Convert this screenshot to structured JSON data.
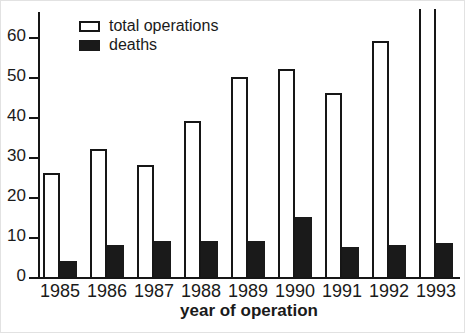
{
  "chart_data": {
    "type": "bar",
    "title": "",
    "xlabel": "year of operation",
    "ylabel": "",
    "categories": [
      "1985",
      "1986",
      "1987",
      "1988",
      "1989",
      "1990",
      "1991",
      "1992",
      "1993"
    ],
    "series": [
      {
        "name": "total operations",
        "fill": "#ffffff",
        "outline": "#161616",
        "values": [
          26,
          32,
          28,
          39,
          50,
          52,
          46,
          59,
          67
        ]
      },
      {
        "name": "deaths",
        "fill": "#1a1a1a",
        "values": [
          4,
          8,
          9,
          9,
          9,
          15,
          7.5,
          8,
          8.5
        ]
      }
    ],
    "clipped_bars": [
      {
        "series": "total operations",
        "category": "1993",
        "note": "bar extends past top of plot, off-scale"
      }
    ],
    "ylim": [
      0,
      66
    ],
    "yticks": [
      0,
      10,
      20,
      30,
      40,
      50,
      60
    ],
    "grid": false,
    "legend_position": "top-left"
  },
  "colors": {
    "background": "#ffffff",
    "axis": "#161616",
    "bar_fill_deaths": "#1a1a1a",
    "bar_outline": "#161616",
    "text": "#1a1a1a"
  }
}
